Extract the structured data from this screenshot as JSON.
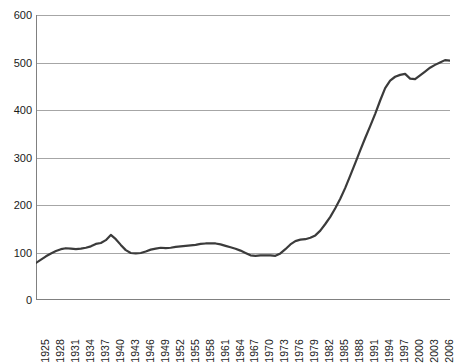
{
  "chart_data": {
    "type": "line",
    "title": "",
    "subtitle": "",
    "xlabel": "",
    "ylabel": "",
    "xlim": [
      1925,
      2008
    ],
    "ylim": [
      0,
      600
    ],
    "y_ticks": [
      0,
      100,
      200,
      300,
      400,
      500,
      600
    ],
    "y_tick_labels": [
      "0",
      "100",
      "200",
      "300",
      "400",
      "500",
      "600"
    ],
    "x_tick_labels": [
      "1925",
      "1928",
      "1931",
      "1934",
      "1937",
      "1940",
      "1943",
      "1946",
      "1949",
      "1952",
      "1955",
      "1958",
      "1961",
      "1964",
      "1967",
      "1970",
      "1973",
      "1976",
      "1979",
      "1982",
      "1985",
      "1988",
      "1991",
      "1994",
      "1997",
      "2000",
      "2003",
      "2006"
    ],
    "x_tick_label_interval": 3,
    "x_minor_tick_interval": 1,
    "grid": "horizontal",
    "legend": "none",
    "line_color": "#3b3b3b",
    "line_width": 2.2,
    "gridline_color": "#a6a6a6",
    "axis_color": "#808080",
    "background": "#ffffff",
    "x": [
      1925,
      1926,
      1927,
      1928,
      1929,
      1930,
      1931,
      1932,
      1933,
      1934,
      1935,
      1936,
      1937,
      1938,
      1939,
      1940,
      1941,
      1942,
      1943,
      1944,
      1945,
      1946,
      1947,
      1948,
      1949,
      1950,
      1951,
      1952,
      1953,
      1954,
      1955,
      1956,
      1957,
      1958,
      1959,
      1960,
      1961,
      1962,
      1963,
      1964,
      1965,
      1966,
      1967,
      1968,
      1969,
      1970,
      1971,
      1972,
      1973,
      1974,
      1975,
      1976,
      1977,
      1978,
      1979,
      1980,
      1981,
      1982,
      1983,
      1984,
      1985,
      1986,
      1987,
      1988,
      1989,
      1990,
      1991,
      1992,
      1993,
      1994,
      1995,
      1996,
      1997,
      1998,
      1999,
      2000,
      2001,
      2002,
      2003,
      2004,
      2005,
      2006,
      2007,
      2008
    ],
    "values": [
      78,
      85,
      92,
      98,
      103,
      107,
      109,
      108,
      107,
      108,
      110,
      113,
      118,
      120,
      126,
      137,
      128,
      116,
      105,
      99,
      98,
      99,
      102,
      106,
      108,
      110,
      109,
      110,
      112,
      113,
      114,
      115,
      116,
      118,
      119,
      119,
      119,
      117,
      114,
      111,
      108,
      104,
      99,
      94,
      93,
      94,
      94,
      94,
      93,
      98,
      107,
      117,
      124,
      127,
      128,
      131,
      136,
      146,
      160,
      175,
      193,
      213,
      236,
      262,
      288,
      315,
      341,
      366,
      392,
      420,
      446,
      462,
      470,
      474,
      476,
      466,
      465,
      473,
      481,
      489,
      495,
      500,
      505,
      504
    ],
    "series": [
      {
        "name": "series-1",
        "values": [
          78,
          85,
          92,
          98,
          103,
          107,
          109,
          108,
          107,
          108,
          110,
          113,
          118,
          120,
          126,
          137,
          128,
          116,
          105,
          99,
          98,
          99,
          102,
          106,
          108,
          110,
          109,
          110,
          112,
          113,
          114,
          115,
          116,
          118,
          119,
          119,
          119,
          117,
          114,
          111,
          108,
          104,
          99,
          94,
          93,
          94,
          94,
          94,
          93,
          98,
          107,
          117,
          124,
          127,
          128,
          131,
          136,
          146,
          160,
          175,
          193,
          213,
          236,
          262,
          288,
          315,
          341,
          366,
          392,
          420,
          446,
          462,
          470,
          474,
          476,
          466,
          465,
          473,
          481,
          489,
          495,
          500,
          505,
          504
        ]
      }
    ],
    "annotations": []
  }
}
